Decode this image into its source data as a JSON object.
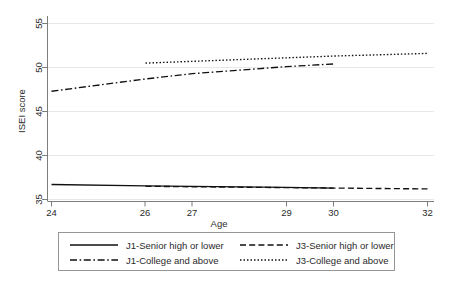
{
  "chart_data": {
    "type": "line",
    "title": "",
    "xlabel": "Age",
    "ylabel": "ISEI score",
    "xlim": [
      24,
      32
    ],
    "ylim": [
      35,
      55
    ],
    "xticks": [
      24,
      26,
      27,
      29,
      30,
      32
    ],
    "xticklabels": [
      "24",
      "26",
      "27",
      "29",
      "30",
      "32"
    ],
    "yticks": [
      35,
      40,
      45,
      50,
      55
    ],
    "yticklabels": [
      "35",
      "40",
      "45",
      "50",
      "55"
    ],
    "grid": "horizontal",
    "legend_position": "below-axes",
    "series": [
      {
        "name": "J1-Senior high or lower",
        "style": "solid",
        "x": [
          24,
          26,
          27,
          29,
          30
        ],
        "values": [
          36.7,
          36.55,
          36.5,
          36.38,
          36.3
        ]
      },
      {
        "name": "J1-College and above",
        "style": "dash-dot",
        "x": [
          24,
          26,
          27,
          29,
          30
        ],
        "values": [
          47.3,
          48.7,
          49.3,
          50.1,
          50.4
        ]
      },
      {
        "name": "J3-Senior high or lower",
        "style": "dashed",
        "x": [
          26,
          27,
          29,
          30,
          32
        ],
        "values": [
          36.5,
          36.45,
          36.35,
          36.3,
          36.2
        ]
      },
      {
        "name": "J3-College and above",
        "style": "dotted",
        "x": [
          26,
          27,
          29,
          30,
          32
        ],
        "values": [
          50.5,
          50.7,
          51.1,
          51.3,
          51.6
        ]
      }
    ]
  },
  "axes": {
    "y_title": "ISEI score",
    "x_title": "Age",
    "y_tick_labels": [
      "55",
      "50",
      "45",
      "40",
      "35"
    ],
    "x_tick_labels": [
      "24",
      "26",
      "27",
      "29",
      "30",
      "32"
    ]
  },
  "legend": {
    "entries": [
      {
        "label": "J1-Senior high or lower",
        "style": "solid"
      },
      {
        "label": "J3-Senior high or lower",
        "style": "dashed"
      },
      {
        "label": "J1-College and above",
        "style": "dash-dot"
      },
      {
        "label": "J3-College and above",
        "style": "dotted"
      }
    ]
  },
  "colors": {
    "line": "#111111",
    "grid": "#e2e2e2",
    "axis": "#6e6e6e",
    "legend_border": "#8c8c8c",
    "background": "#ffffff"
  }
}
